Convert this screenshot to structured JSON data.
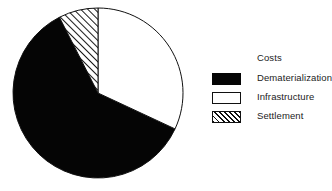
{
  "chart_data": {
    "type": "pie",
    "title": "",
    "legend_title": "Costs",
    "legend_position": "right",
    "grid": false,
    "units": "percent",
    "start_angle_deg": 0,
    "direction": "clockwise",
    "categories": [
      "Dematerialization",
      "Infrastructure",
      "Settlement"
    ],
    "values": [
      60.5,
      32.0,
      7.5
    ],
    "slices": [
      {
        "label": "Dematerialization",
        "value": 60.5,
        "fill": "solid-black",
        "color": "#050505",
        "start_angle_deg": 115,
        "end_angle_deg": 333
      },
      {
        "label": "Infrastructure",
        "value": 32.0,
        "fill": "white-outlined",
        "color": "#ffffff",
        "start_angle_deg": 0,
        "end_angle_deg": 115
      },
      {
        "label": "Settlement",
        "value": 7.5,
        "fill": "diagonal-hatch",
        "color": "#ffffff",
        "start_angle_deg": 333,
        "end_angle_deg": 360
      }
    ]
  },
  "legend": {
    "title": "Costs",
    "entries": [
      {
        "label": "Dematerialization",
        "swatch": "solid"
      },
      {
        "label": "Infrastructure",
        "swatch": "open"
      },
      {
        "label": "Settlement",
        "swatch": "hatch"
      }
    ]
  },
  "colors": {
    "ink": "#111111",
    "fill_dark": "#050505",
    "fill_light": "#ffffff",
    "background": "#ffffff"
  },
  "geometry": {
    "center_x": 98,
    "center_y": 93,
    "radius": 85
  }
}
